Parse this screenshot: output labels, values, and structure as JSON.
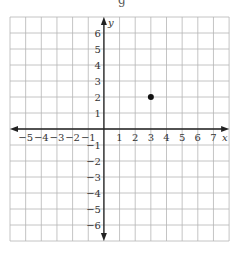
{
  "header_fragment": "g",
  "graph": {
    "x_axis_label": "x",
    "y_axis_label": "y",
    "x_range": [
      -6,
      8
    ],
    "y_range": [
      -7,
      7
    ],
    "x_tick_labels": [
      "−5",
      "−4",
      "−3",
      "−2",
      "−1",
      "1",
      "2",
      "3",
      "4",
      "5",
      "6",
      "7"
    ],
    "y_tick_labels_positive": [
      "1",
      "2",
      "3",
      "4",
      "5",
      "6"
    ],
    "y_tick_labels_negative": [
      "−1",
      "−2",
      "−3",
      "−4",
      "−5",
      "−6"
    ],
    "grid_color": "#b5b5b5",
    "axis_color": "#222222",
    "points": [
      {
        "x": 3,
        "y": 2,
        "color": "#111111"
      }
    ]
  },
  "chart_data": {
    "type": "scatter",
    "title": "",
    "xlabel": "x",
    "ylabel": "y",
    "xlim": [
      -6,
      8
    ],
    "ylim": [
      -7,
      7
    ],
    "grid": true,
    "x_ticks": [
      -5,
      -4,
      -3,
      -2,
      -1,
      1,
      2,
      3,
      4,
      5,
      6,
      7
    ],
    "y_ticks": [
      -6,
      -5,
      -4,
      -3,
      -2,
      -1,
      1,
      2,
      3,
      4,
      5,
      6
    ],
    "series": [
      {
        "name": "point",
        "x": [
          3
        ],
        "y": [
          2
        ]
      }
    ]
  }
}
